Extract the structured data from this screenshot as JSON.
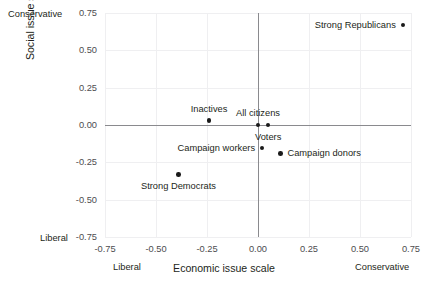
{
  "chart_data": {
    "type": "scatter",
    "title": "",
    "xlabel": "Economic issue scale",
    "ylabel": "Social issue scale",
    "xlim": [
      -0.75,
      0.75
    ],
    "ylim": [
      -0.75,
      0.75
    ],
    "xticks": [
      "-0.75",
      "-0.50",
      "-0.25",
      "0.00",
      "0.25",
      "0.50",
      "0.75"
    ],
    "xtick_values": [
      -0.75,
      -0.5,
      -0.25,
      0,
      0.25,
      0.5,
      0.75
    ],
    "yticks": [
      "0.75",
      "0.50",
      "0.25",
      "0.00",
      "-0.25",
      "-0.50",
      "-0.75"
    ],
    "ytick_values": [
      0.75,
      0.5,
      0.25,
      0,
      -0.25,
      -0.5,
      -0.75
    ],
    "grid": true,
    "legend": "none",
    "axis_anchors": {
      "x_low": "Liberal",
      "x_high": "Conservative",
      "y_low": "Liberal",
      "y_high": "Conservative"
    },
    "point_color": "#1a1a1a",
    "points": [
      {
        "label": "Strong Republicans",
        "x": 0.71,
        "y": 0.67,
        "label_pos": "left"
      },
      {
        "label": "Inactives",
        "x": -0.24,
        "y": 0.03,
        "label_pos": "above"
      },
      {
        "label": "All citizens",
        "x": 0.0,
        "y": 0.0,
        "label_pos": "above"
      },
      {
        "label": "Voters",
        "x": 0.05,
        "y": 0.0,
        "label_pos": "below"
      },
      {
        "label": "Campaign workers",
        "x": 0.02,
        "y": -0.155,
        "label_pos": "left"
      },
      {
        "label": "Campaign donors",
        "x": 0.11,
        "y": -0.19,
        "label_pos": "right"
      },
      {
        "label": "Strong Democrats",
        "x": -0.39,
        "y": -0.33,
        "label_pos": "below"
      }
    ]
  }
}
